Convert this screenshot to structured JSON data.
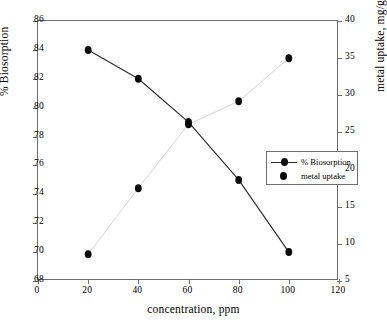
{
  "chart_data": {
    "type": "scatter",
    "title": "",
    "xlabel": "concentration, ppm",
    "ylabel": "% Biosorption",
    "y2label": "metal uptake, mg/g",
    "x": [
      20,
      40,
      60,
      80,
      100
    ],
    "xlim": [
      0,
      120
    ],
    "ylim": [
      68,
      86
    ],
    "y2lim": [
      5,
      40
    ],
    "xticks": [
      "0",
      "20",
      "40",
      "60",
      "80",
      "100",
      "120"
    ],
    "yticks": [
      "68",
      "70",
      "72",
      "74",
      "76",
      "78",
      "80",
      "82",
      "84",
      "86"
    ],
    "y2ticks": [
      "5",
      "10",
      "15",
      "20",
      "25",
      "30",
      "35",
      "40"
    ],
    "grid": false,
    "legend_position": "center-right-inside",
    "series": [
      {
        "name": "% Biosorption",
        "axis": "left",
        "style": "line-marker",
        "marker": "filled-circle",
        "color": "#0a0a0a",
        "values": [
          84.0,
          82.0,
          79.0,
          75.0,
          70.0
        ]
      },
      {
        "name": "metal uptake",
        "axis": "right",
        "style": "marker-only",
        "marker": "filled-circle",
        "color": "#0a0a0a",
        "values": [
          8.6,
          17.5,
          26.1,
          29.2,
          35.0
        ]
      }
    ]
  },
  "legend": {
    "items": [
      {
        "label": "% Biosorption"
      },
      {
        "label": "metal uptake"
      }
    ]
  },
  "colors": {
    "background": "#ffffff",
    "axis": "#6d6d6d",
    "marker": "#0a0a0a",
    "line": "#2b2b2b",
    "text": "#000000"
  }
}
